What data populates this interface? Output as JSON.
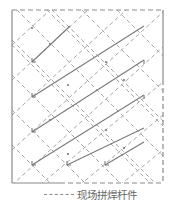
{
  "diagram": {
    "title": "",
    "colors": {
      "solid_line": "#7a7a7a",
      "dashed_line": "#a5a5a5",
      "frame": "#8a8a8a",
      "text": "#666666",
      "background": "#ffffff"
    },
    "frame": {
      "x": 12,
      "y": 10,
      "width": 151,
      "height": 173
    },
    "solid_members": [
      {
        "x1": 32,
        "y1": 62,
        "x2": 70,
        "y2": 26
      },
      {
        "x1": 32,
        "y1": 97,
        "x2": 144,
        "y2": 26
      },
      {
        "x1": 32,
        "y1": 132,
        "x2": 144,
        "y2": 60
      },
      {
        "x1": 32,
        "y1": 165,
        "x2": 144,
        "y2": 95
      },
      {
        "x1": 67,
        "y1": 165,
        "x2": 144,
        "y2": 128
      },
      {
        "x1": 105,
        "y1": 165,
        "x2": 144,
        "y2": 142
      }
    ],
    "legend": {
      "items": [
        {
          "symbol": "dashed-line",
          "label": "现场拼焊杆件"
        }
      ]
    }
  }
}
